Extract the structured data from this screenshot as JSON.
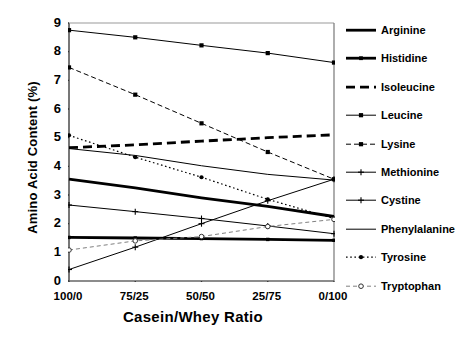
{
  "chart_data": {
    "type": "line",
    "title": "",
    "xlabel": "Casein/Whey Ratio",
    "ylabel": "Amino Acid Content (%)",
    "categories": [
      "100/0",
      "75/25",
      "50/50",
      "25/75",
      "0/100"
    ],
    "xlim": [
      0,
      4
    ],
    "ylim": [
      0,
      9
    ],
    "yticks": [
      "0",
      "1",
      "2",
      "3",
      "4",
      "5",
      "6",
      "7",
      "8",
      "9"
    ],
    "grid": false,
    "legend_position": "right",
    "series": [
      {
        "name": "Arginine",
        "values": [
          3.55,
          3.25,
          2.9,
          2.6,
          2.25
        ],
        "style": "solid",
        "width": 2.8,
        "marker": "none",
        "color": "#000000"
      },
      {
        "name": "Histidine",
        "values": [
          1.52,
          1.5,
          1.48,
          1.45,
          1.42
        ],
        "style": "solid",
        "width": 2.8,
        "marker": "square-small",
        "color": "#000000"
      },
      {
        "name": "Isoleucine",
        "values": [
          4.65,
          4.75,
          4.88,
          5.0,
          5.1
        ],
        "style": "dashed",
        "width": 2.8,
        "marker": "none",
        "color": "#000000"
      },
      {
        "name": "Leucine",
        "values": [
          8.75,
          8.5,
          8.22,
          7.95,
          7.62
        ],
        "style": "solid",
        "width": 1.0,
        "marker": "square",
        "color": "#000000"
      },
      {
        "name": "Lysine",
        "values": [
          7.45,
          6.5,
          5.5,
          4.5,
          3.55
        ],
        "style": "dashed",
        "width": 1.0,
        "marker": "square",
        "color": "#000000"
      },
      {
        "name": "Methionine",
        "values": [
          2.65,
          2.42,
          2.18,
          1.92,
          1.65
        ],
        "style": "solid",
        "width": 1.0,
        "marker": "plus",
        "color": "#000000"
      },
      {
        "name": "Cystine",
        "values": [
          0.4,
          1.18,
          2.0,
          2.8,
          3.55
        ],
        "style": "solid",
        "width": 1.0,
        "marker": "plus",
        "color": "#000000"
      },
      {
        "name": "Phenylalanine",
        "values": [
          4.62,
          4.38,
          4.02,
          3.72,
          3.52
        ],
        "style": "solid",
        "width": 1.0,
        "marker": "none",
        "color": "#000000"
      },
      {
        "name": "Tyrosine",
        "values": [
          5.08,
          4.32,
          3.62,
          2.85,
          2.18
        ],
        "style": "dotted",
        "width": 1.2,
        "marker": "dot",
        "color": "#000000"
      },
      {
        "name": "Tryptophan",
        "values": [
          1.08,
          1.4,
          1.55,
          1.9,
          2.15
        ],
        "style": "dashed-light",
        "width": 1.0,
        "marker": "circle",
        "color": "#808080"
      }
    ]
  },
  "legend": {
    "items": [
      {
        "label": "Arginine"
      },
      {
        "label": "Histidine"
      },
      {
        "label": "Isoleucine"
      },
      {
        "label": "Leucine"
      },
      {
        "label": "Lysine"
      },
      {
        "label": "Methionine"
      },
      {
        "label": "Cystine"
      },
      {
        "label": "Phenylalanine"
      },
      {
        "label": "Tyrosine"
      },
      {
        "label": "Tryptophan"
      }
    ]
  }
}
